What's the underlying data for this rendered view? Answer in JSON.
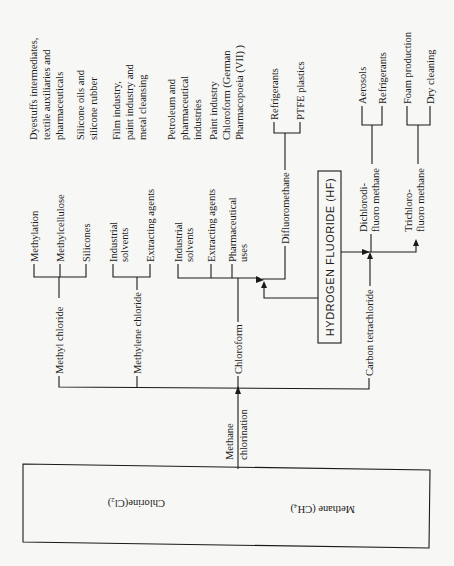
{
  "diagram": {
    "orientation": "rotated-90-ccw",
    "source_box": {
      "chlorine": "Chlorine(Cl₂)",
      "methane": "Methane (CH₄)"
    },
    "process": {
      "line1": "Methane",
      "line2": "chlorination"
    },
    "products": {
      "methyl_chloride": {
        "label": "Methyl chloride",
        "uses": [
          "Methylation",
          "Methylcellulose",
          "Silicones"
        ],
        "applications": {
          "line1": "Dyestuffs intermediates,",
          "line2": "textile auxiliaries and",
          "line3": "pharmaceuticals"
        },
        "silicone_apps": {
          "line1": "Silicone oils and",
          "line2": "silicone rubber"
        }
      },
      "methylene_chloride": {
        "label": "Methylene chloride",
        "uses": {
          "solvents_line1": "Industrial",
          "solvents_line2": "solvents",
          "extracting": "Extracting agents"
        },
        "applications": {
          "line1": "Film industry,",
          "line2": "paint industry and",
          "line3": "metal cleansing"
        },
        "extracting_apps": {
          "line1": "Petroleum and",
          "line2": "pharmaceutical",
          "line3": "industries"
        }
      },
      "chloroform": {
        "label": "Chloroform",
        "uses": {
          "solvents_line1": "Industrial",
          "solvents_line2": "solvents",
          "extracting": "Extracting agents",
          "pharma_line1": "Pharmaceutical",
          "pharma_line2": "uses"
        },
        "applications": {
          "line1": "Paint industry",
          "line2": "Chloroform (German",
          "line3": "Pharmacopoeia (VII) )"
        }
      },
      "carbon_tetrachloride": {
        "label": "Carbon tetrachloride"
      }
    },
    "hf_box": {
      "label": "HYDROGEN FLUORIDE (HF)"
    },
    "fluoro_products": {
      "difluoromethane": {
        "label": "Difluoromethane",
        "uses": [
          "Refrigerants",
          "PTFE plastics"
        ]
      },
      "dichlorodifluoromethane": {
        "line1": "Dichlorodi-",
        "line2": "fluoro methane",
        "uses": [
          "Aerosols",
          "Refrigerants"
        ]
      },
      "trichlorofluoromethane": {
        "line1": "Trichloro-",
        "line2": "fluoro methane",
        "uses": [
          "Foam production",
          "Dry cleaning"
        ]
      }
    }
  }
}
